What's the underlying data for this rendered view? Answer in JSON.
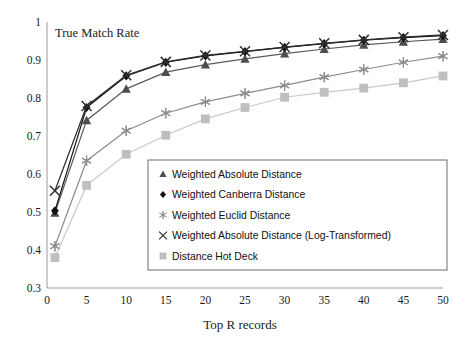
{
  "chart_data": {
    "type": "line",
    "title": "",
    "xlabel": "Top R records",
    "ylabel": "True Match Rate",
    "xlim": [
      0,
      50
    ],
    "ylim": [
      0.3,
      1
    ],
    "xticks": [
      0,
      5,
      10,
      15,
      20,
      25,
      30,
      35,
      40,
      45,
      50
    ],
    "xtick_labels": [
      "0",
      "5",
      "10",
      "15",
      "20",
      "25",
      "30",
      "35",
      "40",
      "45",
      "50"
    ],
    "yticks": [
      0.3,
      0.4,
      0.5,
      0.6,
      0.7,
      0.8,
      0.9,
      1
    ],
    "ytick_labels": [
      "0.3",
      "0.4",
      "0.5",
      "0.6",
      "0.7",
      "0.8",
      "0.9",
      "1"
    ],
    "grid": false,
    "legend_position": "lower-right-inside",
    "x": [
      1,
      5,
      10,
      15,
      20,
      25,
      30,
      35,
      40,
      45,
      50
    ],
    "series": [
      {
        "name": "Weighted Absolute Distance",
        "marker": "triangle",
        "color": "#4d4d4d",
        "line_color": "#5a5a5a",
        "values": [
          0.498,
          0.741,
          0.824,
          0.868,
          0.888,
          0.903,
          0.917,
          0.929,
          0.94,
          0.948,
          0.955
        ]
      },
      {
        "name": "Weighted Canberra Distance",
        "marker": "diamond",
        "color": "#111111",
        "line_color": "#111111",
        "values": [
          0.503,
          0.775,
          0.858,
          0.894,
          0.911,
          0.922,
          0.933,
          0.943,
          0.952,
          0.959,
          0.964
        ]
      },
      {
        "name": "Weighted Euclid Distance",
        "marker": "asterisk",
        "color": "#8c8c8c",
        "line_color": "#8c8c8c",
        "values": [
          0.41,
          0.635,
          0.714,
          0.76,
          0.79,
          0.812,
          0.833,
          0.855,
          0.875,
          0.894,
          0.91
        ]
      },
      {
        "name": "Weighted Absolute Distance (Log-Transformed)",
        "marker": "xcross",
        "color": "#303030",
        "line_color": "#2b2b2b",
        "values": [
          0.556,
          0.779,
          0.86,
          0.895,
          0.912,
          0.923,
          0.934,
          0.944,
          0.953,
          0.96,
          0.966
        ]
      },
      {
        "name": "Distance Hot Deck",
        "marker": "square",
        "color": "#bfbfbf",
        "line_color": "#c9c9c9",
        "values": [
          0.38,
          0.57,
          0.652,
          0.702,
          0.745,
          0.775,
          0.802,
          0.815,
          0.826,
          0.84,
          0.858
        ]
      }
    ]
  },
  "axes": {
    "ylabel_inline": "True Match Rate",
    "xlabel_text": "Top R records"
  }
}
